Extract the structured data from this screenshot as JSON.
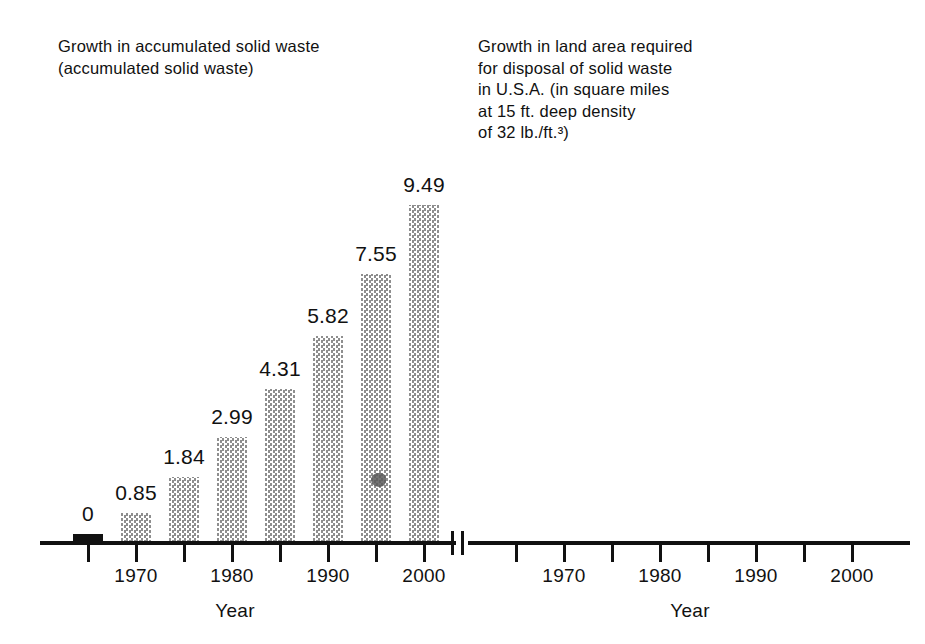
{
  "figure": {
    "background_color": "#ffffff",
    "ink_color": "#111111",
    "bar_fill_color": "#8e8e8e",
    "bar_pattern": "checkerboard-halftone"
  },
  "left_panel": {
    "title": "Growth in accumulated solid waste\n(accumulated solid waste)",
    "axis_name": "Year"
  },
  "right_panel": {
    "title": "Growth in land area required\nfor disposal of solid waste\nin U.S.A. (in square miles\nat 15 ft. deep density\nof 32 lb./ft.³)",
    "axis_name": "Year"
  },
  "chart_data": [
    {
      "type": "bar",
      "title": "Growth in accumulated solid waste (accumulated solid waste)",
      "xlabel": "Year",
      "ylabel": "",
      "categories": [
        "1965",
        "1970",
        "1975",
        "1980",
        "1985",
        "1990",
        "1995",
        "2000"
      ],
      "tick_labels": [
        "",
        "1970",
        "",
        "1980",
        "",
        "1990",
        "",
        "2000"
      ],
      "values": [
        0,
        0.85,
        1.84,
        2.99,
        4.31,
        5.82,
        7.55,
        9.49
      ],
      "value_labels": [
        "0",
        "0.85",
        "1.84",
        "2.99",
        "4.31",
        "5.82",
        "7.55",
        "9.49"
      ],
      "ylim": [
        0,
        9.49
      ],
      "grid": false,
      "legend": "none"
    },
    {
      "type": "bar",
      "title": "Growth in land area required for disposal of solid waste in U.S.A. (in square miles at 15 ft. deep density of 32 lb./ft.³)",
      "xlabel": "Year",
      "ylabel": "",
      "categories": [
        "1965",
        "1970",
        "1975",
        "1980",
        "1985",
        "1990",
        "1995",
        "2000"
      ],
      "tick_labels": [
        "",
        "1970",
        "",
        "1980",
        "",
        "1990",
        "",
        "2000"
      ],
      "values": [
        0,
        140,
        305,
        516,
        727,
        984,
        1266,
        1594
      ],
      "value_labels": [
        "0",
        "140",
        "305",
        "516",
        "727",
        "984",
        "1,266",
        "1,594"
      ],
      "ylim": [
        0,
        1594
      ],
      "grid": false,
      "legend": "none"
    }
  ]
}
